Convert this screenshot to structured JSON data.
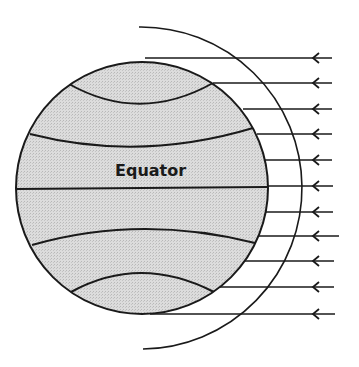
{
  "diagram": {
    "type": "earth-solar-radiation",
    "labels": {
      "equator": "Equator"
    },
    "colors": {
      "line": "#1a1a1a",
      "globe_fill": "#d9d9d9",
      "background": "#ffffff"
    },
    "globe": {
      "cx": 142,
      "cy": 188,
      "r": 126
    },
    "outer_arc": {
      "cx": 139,
      "cy": 188,
      "r": 160,
      "top": [
        139,
        27
      ],
      "bottom": [
        143,
        349
      ]
    },
    "equator_line": {
      "x1": 17,
      "y1": 189,
      "x2": 267,
      "y2": 187
    },
    "latitude_lines": [
      {
        "name": "upper-high",
        "path": "M69,84 Q140,124 213,83"
      },
      {
        "name": "upper-mid",
        "path": "M30,134 Q140,162 253,128"
      },
      {
        "name": "lower-mid",
        "path": "M32,245 Q140,214 255,243"
      },
      {
        "name": "lower-high",
        "path": "M71,292 Q140,254 214,292"
      }
    ],
    "rays": [
      {
        "y": 58,
        "x_start": 145,
        "x_end": 332
      },
      {
        "y": 83,
        "x_start": 213,
        "x_end": 332
      },
      {
        "y": 109,
        "x_start": 243,
        "x_end": 332
      },
      {
        "y": 134,
        "x_start": 257,
        "x_end": 332
      },
      {
        "y": 160,
        "x_start": 265,
        "x_end": 332
      },
      {
        "y": 186,
        "x_start": 267,
        "x_end": 333
      },
      {
        "y": 212,
        "x_start": 265,
        "x_end": 333
      },
      {
        "y": 236,
        "x_start": 258,
        "x_end": 339
      },
      {
        "y": 261,
        "x_start": 245,
        "x_end": 334
      },
      {
        "y": 287,
        "x_start": 220,
        "x_end": 334
      },
      {
        "y": 314,
        "x_start": 150,
        "x_end": 335
      }
    ],
    "arrowhead_x": 313,
    "arrow_direction": "left"
  }
}
